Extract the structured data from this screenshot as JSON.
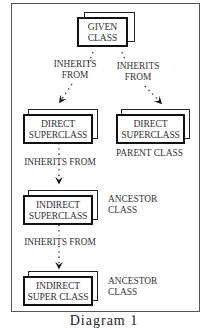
{
  "diagram": {
    "boxes": {
      "given": {
        "line1": "GIVEN",
        "line2": "CLASS"
      },
      "direct_left": {
        "line1": "DIRECT",
        "line2": "SUPERCLASS"
      },
      "direct_right": {
        "line1": "DIRECT",
        "line2": "SUPERCLASS"
      },
      "indirect_1": {
        "line1": "INDIRECT",
        "line2": "SUPERCLASS"
      },
      "indirect_2": {
        "line1": "INDIRECT",
        "line2": "SUPER CLASS"
      }
    },
    "edges": [
      {
        "from": "given",
        "to": "direct_left",
        "label_line1": "INHERITS",
        "label_line2": "FROM"
      },
      {
        "from": "given",
        "to": "direct_right",
        "label_line1": "INHERITS",
        "label_line2": "FROM"
      },
      {
        "from": "direct_left",
        "to": "indirect_1",
        "label": "INHERITS FROM"
      },
      {
        "from": "indirect_1",
        "to": "indirect_2",
        "label": "INHERITS FROM"
      }
    ],
    "annotations": {
      "parent_class": "PARENT CLASS",
      "ancestor_1_line1": "ANCESTOR",
      "ancestor_1_line2": "CLASS",
      "ancestor_2_line1": "ANCESTOR",
      "ancestor_2_line2": "CLASS"
    },
    "caption": "Diagram 1"
  }
}
